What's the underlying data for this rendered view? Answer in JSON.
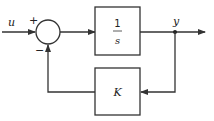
{
  "diagram": {
    "type": "block-diagram",
    "input_label": "u",
    "output_label": "y",
    "summing_junction": {
      "plus_sign": "+",
      "minus_sign": "−"
    },
    "forward_block": {
      "numerator": "1",
      "denominator": "s"
    },
    "feedback_block": {
      "label": "K"
    },
    "colors": {
      "line": "#333333",
      "background": "#ffffff"
    }
  }
}
